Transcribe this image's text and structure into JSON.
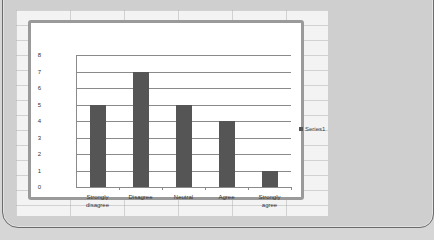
{
  "chart_data": {
    "type": "bar",
    "title": "",
    "xlabel": "",
    "ylabel": "",
    "categories": [
      "Strongly disagree",
      "Disagree",
      "Neutral",
      "Agree",
      "Strongly agree"
    ],
    "series": [
      {
        "name": "Series1",
        "values": [
          5,
          7,
          5,
          4,
          1
        ],
        "color": "#555555"
      }
    ],
    "ylim": [
      0,
      8
    ],
    "yticks": [
      "0",
      "1",
      "2",
      "3",
      "4",
      "5",
      "6",
      "7",
      "8"
    ],
    "grid": true,
    "legend_position": "right"
  },
  "labels": {
    "cat0_line1": "Strongly",
    "cat0_line2": "disagree",
    "cat1": "Disagree",
    "cat2": "Neutral",
    "cat3": "Agree",
    "cat4_line1": "Strongly",
    "cat4_line2": "agree",
    "legend": "Series1"
  }
}
